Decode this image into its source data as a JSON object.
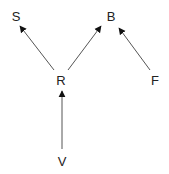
{
  "diagram": {
    "type": "directed-graph",
    "nodes": [
      {
        "id": "S",
        "label": "S",
        "x": 16,
        "y": 16
      },
      {
        "id": "B",
        "label": "B",
        "x": 111,
        "y": 16
      },
      {
        "id": "R",
        "label": "R",
        "x": 61,
        "y": 79
      },
      {
        "id": "F",
        "label": "F",
        "x": 155,
        "y": 79
      },
      {
        "id": "V",
        "label": "V",
        "x": 62,
        "y": 161
      }
    ],
    "edges": [
      {
        "from": "R",
        "to": "S"
      },
      {
        "from": "R",
        "to": "B"
      },
      {
        "from": "F",
        "to": "B"
      },
      {
        "from": "V",
        "to": "R"
      }
    ],
    "colors": {
      "edge": "#555555",
      "arrowhead": "#111111",
      "text": "#222222"
    }
  }
}
